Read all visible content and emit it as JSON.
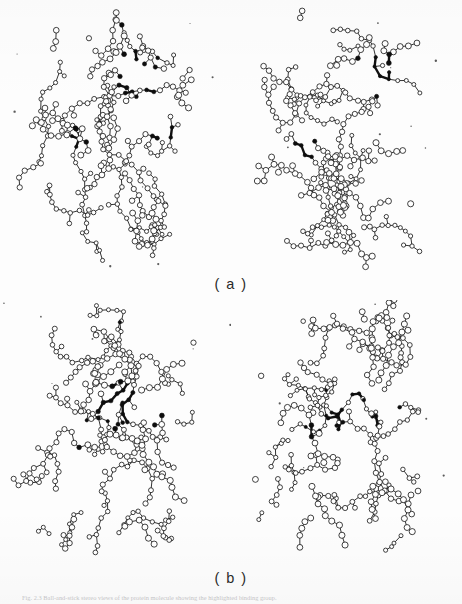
{
  "figure": {
    "kind": "stereo-pair-molecular-model",
    "representation": "ball-and-stick",
    "background_color": "#fdfdfd",
    "ink_color": "#111111",
    "atom_fill_open": "#ffffff",
    "atom_fill_solid": "#0d0d0d",
    "panels": [
      {
        "id": "a",
        "label": "( a )",
        "views": [
          "left",
          "right"
        ],
        "stereo_offset_deg": 6,
        "description": "Stereo pair of a globular protein backbone with side chains; a bound ligand group and two side-chain clusters are drawn with solid black atoms."
      },
      {
        "id": "b",
        "label": "( b )",
        "views": [
          "left",
          "right"
        ],
        "stereo_offset_deg": 6,
        "description": "Second stereo pair of the same protein in a different orientation / conformation; the solid black highlighted group sits nearer the centre of the molecule."
      }
    ],
    "caption": "Fig. 2.3  Ball-and-stick stereo views of the protein molecule showing the highlighted binding group."
  },
  "chart_data": {
    "type": "scatter",
    "title": "",
    "note": "Rendered molecule is a structural diagram, not a quantitative plot.",
    "seeds": {
      "a_left": 1741,
      "a_right": 1747,
      "b_left": 2311,
      "b_right": 2317
    },
    "atom_count_per_view": 295,
    "highlight_clusters": {
      "a": [
        {
          "cx": 0.63,
          "cy": 0.26,
          "r": 0.115,
          "weight": 0.95
        },
        {
          "cx": 0.72,
          "cy": 0.46,
          "r": 0.075,
          "weight": 0.9
        },
        {
          "cx": 0.31,
          "cy": 0.53,
          "r": 0.065,
          "weight": 0.85
        },
        {
          "cx": 0.53,
          "cy": 0.07,
          "r": 0.03,
          "weight": 0.7
        }
      ],
      "b": [
        {
          "cx": 0.5,
          "cy": 0.38,
          "r": 0.105,
          "weight": 0.95
        },
        {
          "cx": 0.69,
          "cy": 0.4,
          "r": 0.085,
          "weight": 0.92
        },
        {
          "cx": 0.32,
          "cy": 0.5,
          "r": 0.07,
          "weight": 0.85
        },
        {
          "cx": 0.52,
          "cy": 0.04,
          "r": 0.028,
          "weight": 0.7
        }
      ]
    },
    "blob_outline": {
      "note": "Overall molecular envelope is a rounded, slightly peanut-shaped globule with a notch on the right side at mid height.",
      "lobes": [
        {
          "cx": 0.47,
          "cy": 0.3,
          "rx": 0.42,
          "ry": 0.31
        },
        {
          "cx": 0.44,
          "cy": 0.7,
          "rx": 0.4,
          "ry": 0.3
        },
        {
          "cx": 0.62,
          "cy": 0.22,
          "rx": 0.26,
          "ry": 0.2
        },
        {
          "cx": 0.6,
          "cy": 0.78,
          "rx": 0.26,
          "ry": 0.21
        }
      ]
    }
  }
}
